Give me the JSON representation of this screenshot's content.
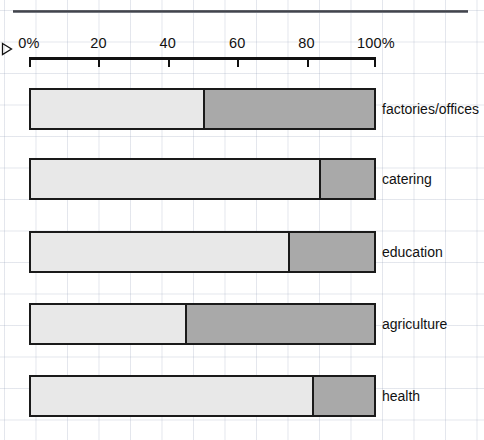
{
  "chart_data": {
    "type": "bar",
    "orientation": "horizontal",
    "stacked": true,
    "title": "",
    "xlabel": "",
    "ylabel": "",
    "xlim": [
      0,
      100
    ],
    "xunit": "%",
    "grid": true,
    "legend": "none",
    "tick_labels": [
      "0%",
      "20",
      "40",
      "60",
      "80",
      "100%"
    ],
    "tick_values": [
      0,
      20,
      40,
      60,
      80,
      100
    ],
    "categories": [
      "factories/offices",
      "catering",
      "education",
      "agriculture",
      "health"
    ],
    "series": [
      {
        "name": "segment-1",
        "values": [
          50,
          84,
          75,
          45,
          82
        ]
      },
      {
        "name": "segment-2",
        "values": [
          50,
          16,
          25,
          55,
          18
        ]
      }
    ],
    "colors": {
      "segment_1_fill": "#e8e8e8",
      "segment_2_fill": "#a9a9a9",
      "bar_outline": "#1a1a1a",
      "axis": "#111111",
      "grid": "#96a0b9",
      "background": "#ffffff"
    }
  },
  "marker": {
    "glyph": "triangle-right"
  }
}
